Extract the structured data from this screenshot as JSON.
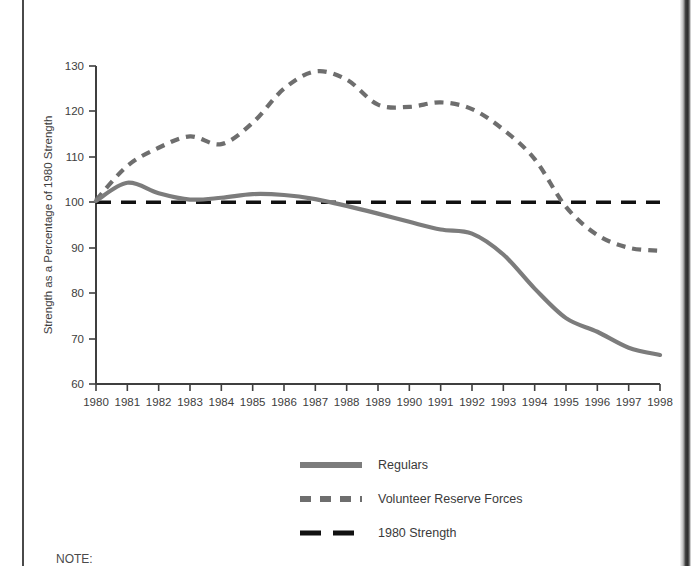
{
  "document": {
    "note_label": "NOTE:"
  },
  "chart_data": {
    "type": "line",
    "title": "",
    "xlabel": "",
    "ylabel": "Strength as a Percentage of 1980 Strength",
    "xlim": [
      1980,
      1998
    ],
    "ylim": [
      60,
      130
    ],
    "yticks": [
      60,
      70,
      80,
      90,
      100,
      110,
      120,
      130
    ],
    "grid": false,
    "legend_position": "bottom",
    "categories": [
      1980,
      1981,
      1982,
      1983,
      1984,
      1985,
      1986,
      1987,
      1988,
      1989,
      1990,
      1991,
      1992,
      1993,
      1994,
      1995,
      1996,
      1997,
      1998
    ],
    "xticklabels": [
      "1980",
      "1981",
      "1982",
      "1983",
      "1984",
      "1985",
      "1986",
      "1987",
      "1988",
      "1989",
      "1990",
      "1991",
      "1992",
      "1993",
      "1994",
      "1995",
      "1996",
      "1997",
      "1998"
    ],
    "series": [
      {
        "name": "Regulars",
        "style": "solid",
        "color": "#7c7c7c",
        "values": [
          100.3,
          104.3,
          102.0,
          100.6,
          101.0,
          101.8,
          101.6,
          100.7,
          99.2,
          97.5,
          95.7,
          94.0,
          93.1,
          88.5,
          81.0,
          74.5,
          71.5,
          68.0,
          66.4
        ]
      },
      {
        "name": "Volunteer Reserve Forces",
        "style": "dashed",
        "color": "#6e6e6e",
        "values": [
          100.5,
          108.0,
          112.0,
          114.5,
          112.8,
          117.5,
          125.0,
          128.8,
          127.0,
          121.5,
          121.0,
          122.0,
          120.5,
          116.0,
          109.5,
          99.0,
          92.8,
          90.0,
          89.3
        ]
      },
      {
        "name": "1980 Strength",
        "style": "dashed-reference",
        "color": "#111111",
        "values": [
          100,
          100,
          100,
          100,
          100,
          100,
          100,
          100,
          100,
          100,
          100,
          100,
          100,
          100,
          100,
          100,
          100,
          100,
          100
        ]
      }
    ],
    "legend": [
      {
        "label": "Regulars",
        "swatch": "solid-gray-line",
        "color": "#7c7c7c"
      },
      {
        "label": "Volunteer Reserve Forces",
        "swatch": "dashed-gray-line",
        "color": "#6e6e6e"
      },
      {
        "label": "1980 Strength",
        "swatch": "dashed-black-line",
        "color": "#111111"
      }
    ]
  }
}
